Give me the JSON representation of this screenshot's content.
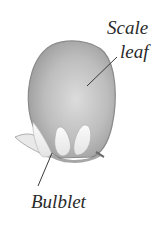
{
  "diagram": {
    "labels": {
      "scale_leaf_line1": "Scale",
      "scale_leaf_line2": "leaf",
      "bulblet": "Bulblet"
    },
    "colors": {
      "scale_leaf_fill": "#b9b9b9",
      "scale_leaf_edge": "#8a8a8a",
      "bulblet_fill": "#f2f2f2",
      "leader_line": "#3a3a3a",
      "text": "#2a2a2a"
    }
  }
}
